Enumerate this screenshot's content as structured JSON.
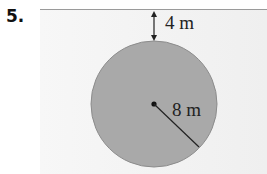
{
  "problem": {
    "number": "5."
  },
  "diagram": {
    "gap_label": "4 m",
    "radius_label": "8 m",
    "colors": {
      "circle_fill": "#a9a9a9",
      "circle_stroke": "#8c8c8c",
      "line": "#222222",
      "background": "#f2f2f2"
    }
  }
}
